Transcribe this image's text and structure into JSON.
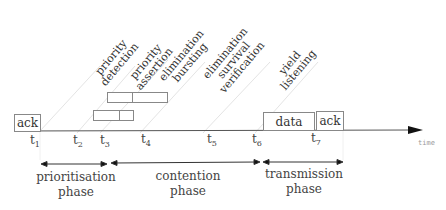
{
  "diagram": {
    "type": "protocol timing diagram",
    "axis_label": "time",
    "frames": {
      "ack_start": "ack",
      "data": "data",
      "ack_end": "ack"
    },
    "ticks": [
      {
        "base": "t",
        "sub": "1"
      },
      {
        "base": "t",
        "sub": "2"
      },
      {
        "base": "t",
        "sub": "3"
      },
      {
        "base": "t",
        "sub": "4"
      },
      {
        "base": "t",
        "sub": "5"
      },
      {
        "base": "t",
        "sub": "6"
      },
      {
        "base": "t",
        "sub": "7"
      }
    ],
    "events": [
      {
        "line1": "priority",
        "line2": "detection",
        "line3": ""
      },
      {
        "line1": "priority",
        "line2": "assertion",
        "line3": ""
      },
      {
        "line1": "elimination",
        "line2": "bursting",
        "line3": ""
      },
      {
        "line1": "elimination",
        "line2": "survival",
        "line3": "verification"
      },
      {
        "line1": "yield",
        "line2": "listening",
        "line3": ""
      }
    ],
    "phases": [
      {
        "line1": "prioritisation",
        "line2": "phase"
      },
      {
        "line1": "contention",
        "line2": "phase"
      },
      {
        "line1": "transmission",
        "line2": "phase"
      }
    ],
    "colors": {
      "axis": "#555555",
      "box_border": "#888888",
      "diagonal": "#e6e6e6",
      "text": "#333333"
    }
  }
}
